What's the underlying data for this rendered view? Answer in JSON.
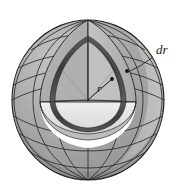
{
  "figure": {
    "kind": "sphere-cutaway-shell-diagram",
    "background_color": "#ffffff",
    "labels": {
      "radius": "r",
      "thickness": "dr"
    },
    "colors": {
      "outer_surface": "#a8a8a8",
      "outer_surface_dark": "#8e8e8e",
      "outer_surface_light": "#c2c2c2",
      "inner_wedge_face": "#b6b6b6",
      "inner_wedge_face_dark": "#9c9c9c",
      "cut_plane_top": "#e2e2e2",
      "shell_rim": "#4a4a4a",
      "grid_line": "#2b2b2b",
      "outline": "#1f1f1f",
      "dot": "#111111",
      "leader_line": "#1a1a1a"
    },
    "geometry": {
      "sphere_center_x": 88,
      "sphere_center_y": 100,
      "sphere_radius_x": 76,
      "sphere_radius_y": 80,
      "inner_shell_radius": 52,
      "shell_thickness": 4,
      "latitude_count": 7,
      "longitude_count": 9
    },
    "annotations": {
      "dr_label_x": 156,
      "dr_label_y": 54,
      "r_label_x": 97,
      "r_label_y": 90,
      "dot_outer_x": 127,
      "dot_outer_y": 71,
      "dot_inner_x": 112,
      "dot_inner_y": 79
    }
  }
}
